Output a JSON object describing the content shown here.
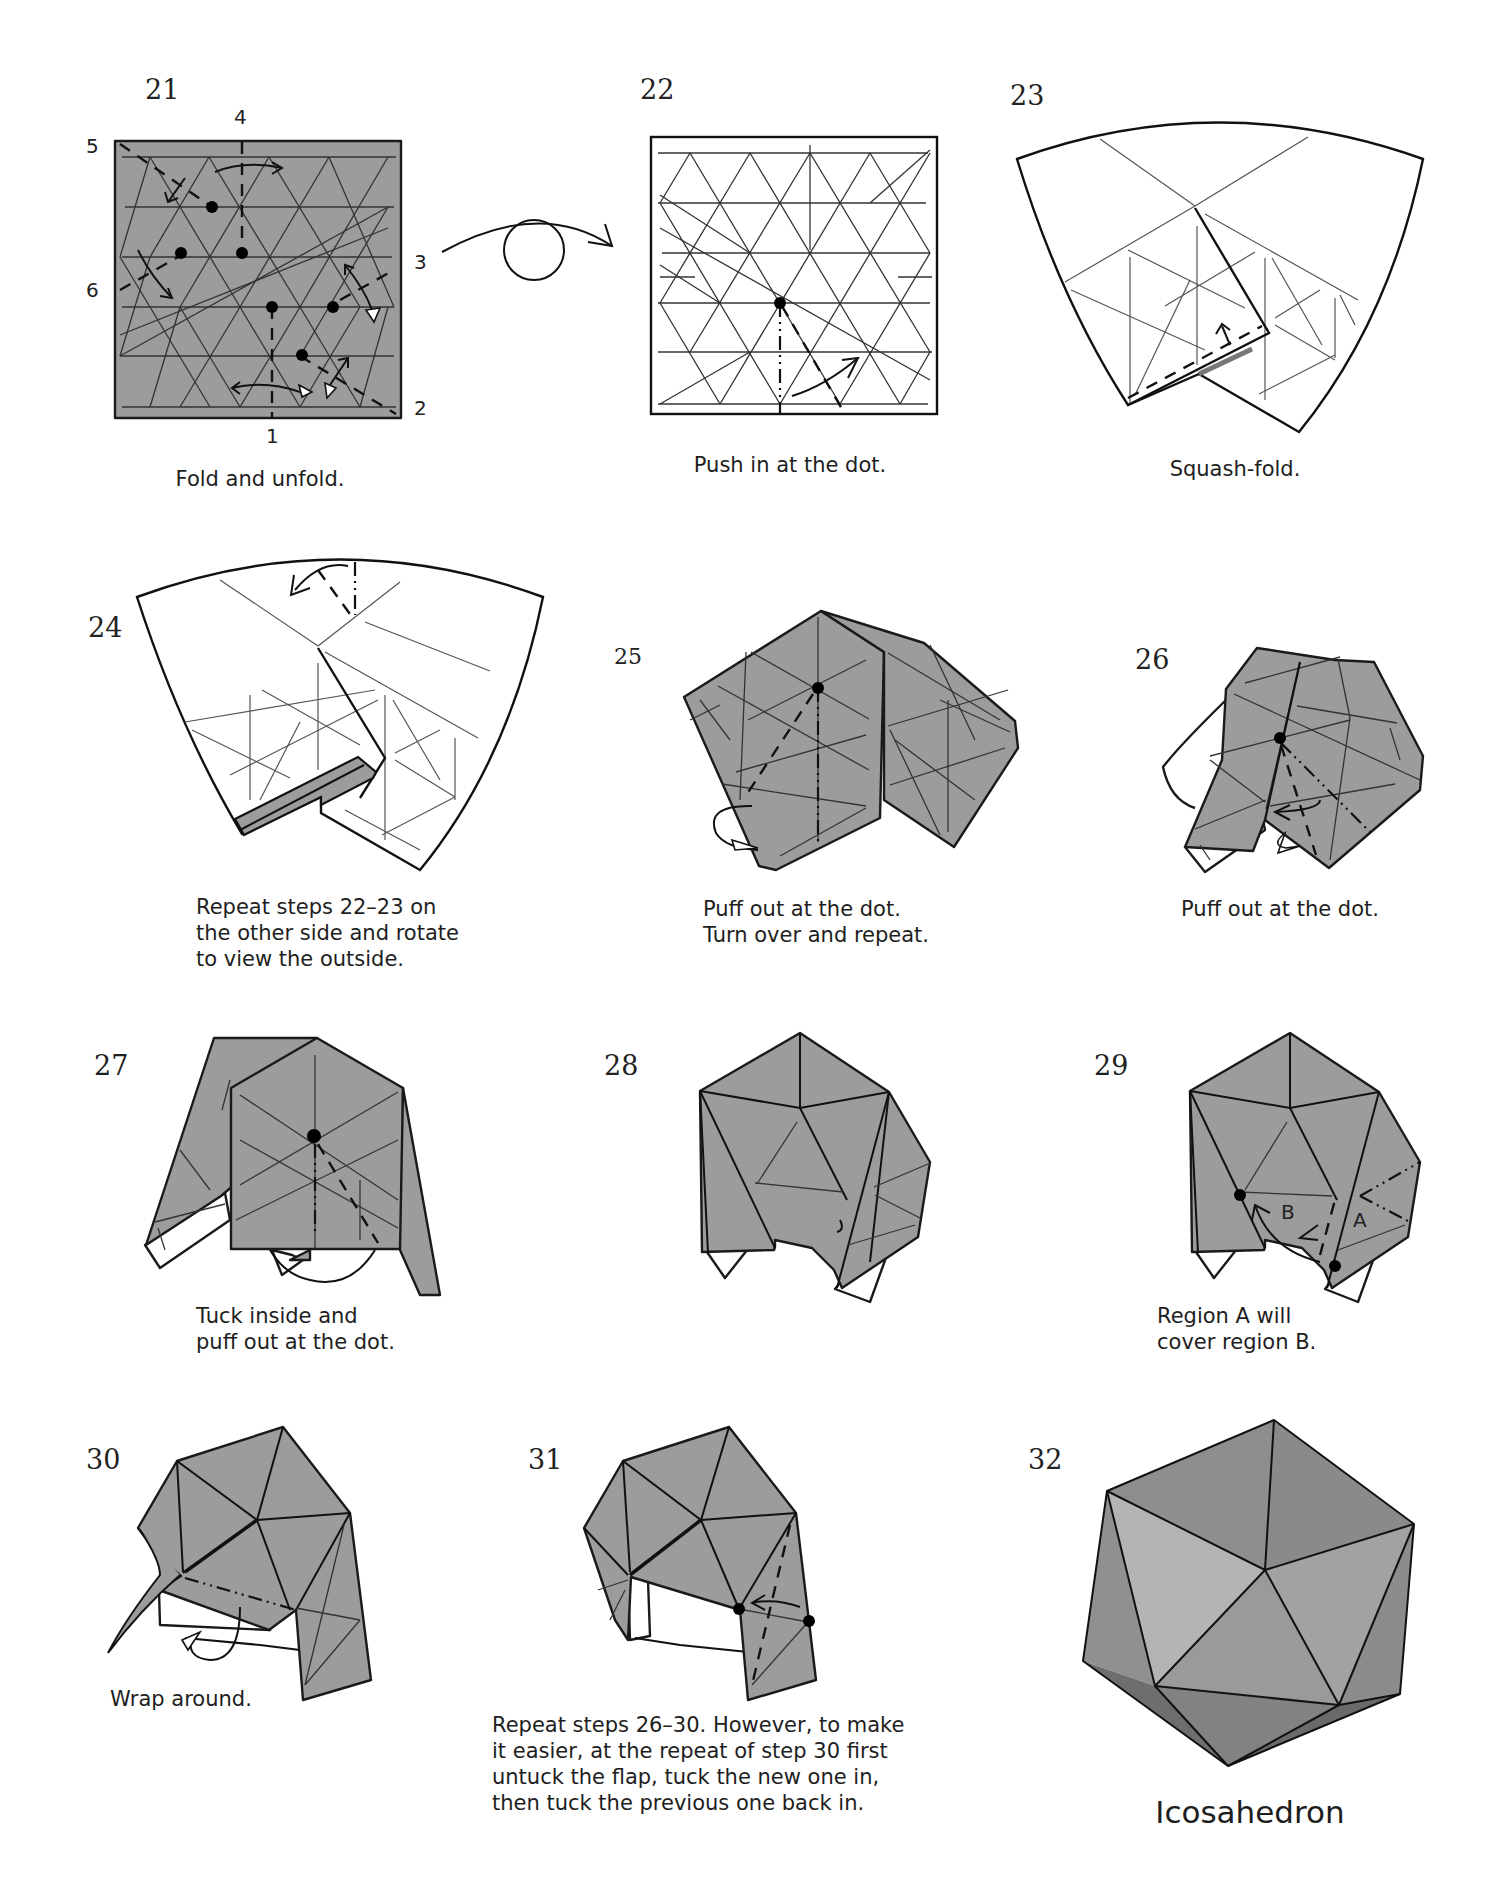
{
  "page": {
    "background": "#ffffff",
    "paper_color": "#9c9c9c"
  },
  "steps": [
    {
      "number": "21",
      "caption": "Fold and unfold.",
      "edge_labels": [
        "1",
        "2",
        "3",
        "4",
        "5",
        "6"
      ]
    },
    {
      "number": "22",
      "caption": "Push in at the dot.",
      "symbol": "turn-over"
    },
    {
      "number": "23",
      "caption": "Squash-fold."
    },
    {
      "number": "24",
      "caption": "Repeat steps 22–23 on\nthe other side and rotate\nto view the outside."
    },
    {
      "number": "25",
      "caption": "Puff out at the dot.\nTurn over and repeat."
    },
    {
      "number": "26",
      "caption": "Puff out at the dot."
    },
    {
      "number": "27",
      "caption": "Tuck inside and\npuff out at the dot."
    },
    {
      "number": "28",
      "caption": ""
    },
    {
      "number": "29",
      "caption": "Region A will\ncover region B.",
      "region_labels": [
        "A",
        "B"
      ]
    },
    {
      "number": "30",
      "caption": "Wrap around."
    },
    {
      "number": "31",
      "caption": "Repeat steps 26–30. However, to make\nit easier, at the repeat of step 30 first\nuntuck the flap, tuck the new one in,\nthen tuck the previous one back in."
    },
    {
      "number": "32",
      "caption": "Icosahedron"
    }
  ]
}
